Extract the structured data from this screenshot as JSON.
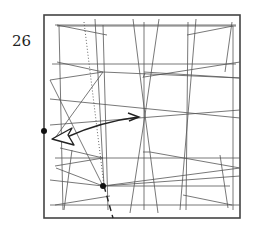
{
  "step": {
    "number": "26"
  },
  "colors": {
    "frame": "#444444",
    "crease": "#555555",
    "arrow": "#222222",
    "dot": "#111111",
    "background": "#ffffff"
  },
  "diagram": {
    "frame": {
      "x": 44,
      "y": 15,
      "width": 196,
      "height": 203
    },
    "creases": [
      {
        "x1": 55,
        "y1": 25,
        "x2": 236,
        "y2": 25
      },
      {
        "x1": 57,
        "y1": 26,
        "x2": 236,
        "y2": 26
      },
      {
        "x1": 57,
        "y1": 25,
        "x2": 107,
        "y2": 35
      },
      {
        "x1": 187,
        "y1": 35,
        "x2": 233,
        "y2": 26
      },
      {
        "x1": 59,
        "y1": 25,
        "x2": 63,
        "y2": 210
      },
      {
        "x1": 95,
        "y1": 19,
        "x2": 104,
        "y2": 186
      },
      {
        "x1": 103,
        "y1": 25,
        "x2": 108,
        "y2": 210
      },
      {
        "x1": 133,
        "y1": 19,
        "x2": 145,
        "y2": 115
      },
      {
        "x1": 144,
        "y1": 22,
        "x2": 144,
        "y2": 210
      },
      {
        "x1": 159,
        "y1": 19,
        "x2": 145,
        "y2": 115
      },
      {
        "x1": 145,
        "y1": 115,
        "x2": 130,
        "y2": 213
      },
      {
        "x1": 145,
        "y1": 115,
        "x2": 158,
        "y2": 213
      },
      {
        "x1": 188,
        "y1": 22,
        "x2": 186,
        "y2": 210
      },
      {
        "x1": 196,
        "y1": 19,
        "x2": 180,
        "y2": 210
      },
      {
        "x1": 232,
        "y1": 22,
        "x2": 225,
        "y2": 72
      },
      {
        "x1": 233,
        "y1": 26,
        "x2": 233,
        "y2": 210
      },
      {
        "x1": 52,
        "y1": 64,
        "x2": 236,
        "y2": 64
      },
      {
        "x1": 50,
        "y1": 80,
        "x2": 103,
        "y2": 72
      },
      {
        "x1": 103,
        "y1": 72,
        "x2": 240,
        "y2": 78
      },
      {
        "x1": 57,
        "y1": 62,
        "x2": 103,
        "y2": 72
      },
      {
        "x1": 144,
        "y1": 72,
        "x2": 240,
        "y2": 78
      },
      {
        "x1": 143,
        "y1": 78,
        "x2": 145,
        "y2": 73
      },
      {
        "x1": 144,
        "y1": 77,
        "x2": 240,
        "y2": 62
      },
      {
        "x1": 50,
        "y1": 99,
        "x2": 240,
        "y2": 118
      },
      {
        "x1": 50,
        "y1": 125,
        "x2": 240,
        "y2": 110
      },
      {
        "x1": 103,
        "y1": 72,
        "x2": 55,
        "y2": 138
      },
      {
        "x1": 50,
        "y1": 80,
        "x2": 103,
        "y2": 186
      },
      {
        "x1": 60,
        "y1": 148,
        "x2": 103,
        "y2": 158
      },
      {
        "x1": 55,
        "y1": 158,
        "x2": 240,
        "y2": 158
      },
      {
        "x1": 55,
        "y1": 166,
        "x2": 103,
        "y2": 158
      },
      {
        "x1": 103,
        "y1": 186,
        "x2": 230,
        "y2": 186
      },
      {
        "x1": 50,
        "y1": 205,
        "x2": 240,
        "y2": 205
      },
      {
        "x1": 50,
        "y1": 180,
        "x2": 103,
        "y2": 186
      },
      {
        "x1": 56,
        "y1": 168,
        "x2": 103,
        "y2": 186
      },
      {
        "x1": 103,
        "y1": 186,
        "x2": 240,
        "y2": 168
      },
      {
        "x1": 150,
        "y1": 152,
        "x2": 240,
        "y2": 168
      },
      {
        "x1": 143,
        "y1": 152,
        "x2": 150,
        "y2": 152
      },
      {
        "x1": 103,
        "y1": 186,
        "x2": 240,
        "y2": 176
      },
      {
        "x1": 183,
        "y1": 195,
        "x2": 232,
        "y2": 205
      },
      {
        "x1": 55,
        "y1": 205,
        "x2": 110,
        "y2": 196
      },
      {
        "x1": 72,
        "y1": 150,
        "x2": 64,
        "y2": 210
      },
      {
        "x1": 220,
        "y1": 155,
        "x2": 228,
        "y2": 208
      }
    ],
    "dotted_line": {
      "x1": 84,
      "y1": 22,
      "x2": 104,
      "y2": 186
    },
    "dashed_line": {
      "x1": 104,
      "y1": 186,
      "x2": 113,
      "y2": 218
    },
    "dots": [
      {
        "name": "left-edge-point",
        "cx": 44,
        "cy": 131,
        "r": 3
      },
      {
        "name": "reference-point",
        "cx": 103,
        "cy": 186,
        "r": 3
      }
    ],
    "arrow": {
      "path": "M 67 137 Q 100 122 138 117",
      "head_start_outline": "M 52 139 L 72 128 L 68 135 L 74 145 Z",
      "head_end": "M 128 113 L 139 117 L 129 121"
    }
  }
}
